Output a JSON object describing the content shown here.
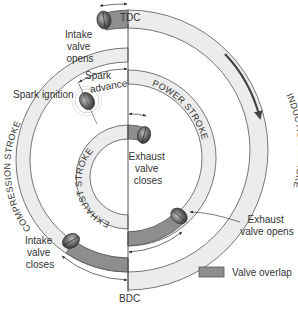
{
  "diagram": {
    "markers": {
      "top": "TDC",
      "bottom": "BDC"
    },
    "strokes": [
      {
        "id": "induction",
        "label": "INDUCTION STROKE"
      },
      {
        "id": "compression",
        "label": "COMPRESSION STROKE"
      },
      {
        "id": "power",
        "label": "POWER STROKE"
      },
      {
        "id": "exhaust",
        "label": "EXHAUST STROKE"
      }
    ],
    "events": {
      "intake_opens": [
        "Intake",
        "valve",
        "opens"
      ],
      "spark_advance": [
        "Spark",
        "advance"
      ],
      "spark_ignition": "Spark ignition",
      "exhaust_closes": [
        "Exhaust",
        "valve",
        "closes"
      ],
      "exhaust_opens": [
        "Exhaust",
        "valve opens"
      ],
      "intake_closes": [
        "Intake",
        "valve",
        "closes"
      ]
    },
    "legend": {
      "label": "Valve overlap",
      "color": "#8e8e8e"
    },
    "colors": {
      "ring_fill": "#ececec",
      "overlap_fill": "#8e8e8e",
      "outline": "#555555",
      "valve": "#6f6f6f",
      "arrow": "#333333"
    },
    "rotation_direction": "clockwise"
  }
}
